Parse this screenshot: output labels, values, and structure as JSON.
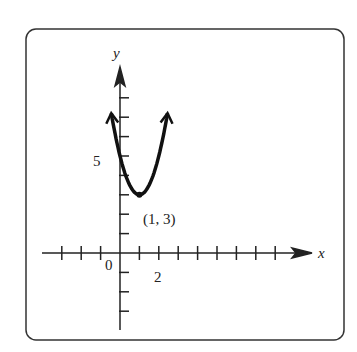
{
  "chart_data": {
    "type": "line",
    "title": "",
    "xlabel": "x",
    "ylabel": "y",
    "function": "parabola opening upward with vertex (1, 3)",
    "vertex": {
      "x": 1,
      "y": 3,
      "label": "(1, 3)"
    },
    "x_tick_labels": [
      {
        "value": 0,
        "label": "0"
      },
      {
        "value": 2,
        "label": "2"
      }
    ],
    "y_tick_labels": [
      {
        "value": 5,
        "label": "5"
      }
    ],
    "x_ticks": [
      -3,
      -2,
      -1,
      1,
      2,
      3,
      4,
      5,
      6,
      7,
      8
    ],
    "y_ticks": [
      -3,
      -2,
      -1,
      1,
      2,
      3,
      4,
      5,
      6,
      7,
      8
    ],
    "xlim": [
      -4,
      10
    ],
    "ylim": [
      -4,
      10
    ],
    "points": [
      {
        "x": -0.5,
        "y": 7.5
      },
      {
        "x": 0,
        "y": 5
      },
      {
        "x": 1,
        "y": 3
      },
      {
        "x": 2,
        "y": 5
      },
      {
        "x": 2.5,
        "y": 7.5
      }
    ],
    "grid": false,
    "legend": null
  },
  "labels": {
    "x_axis": "x",
    "y_axis": "y",
    "origin": "0",
    "x_two": "2",
    "y_five": "5",
    "vertex": "(1, 3)"
  }
}
